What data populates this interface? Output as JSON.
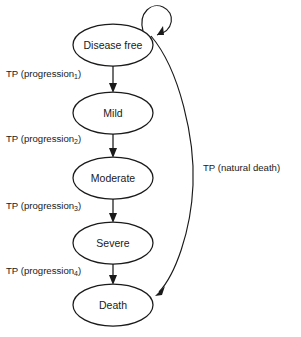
{
  "diagram": {
    "type": "state-transition-diagram",
    "title": "",
    "nodes": [
      {
        "id": "disease-free",
        "label": "Disease free",
        "cx": 113,
        "cy": 45,
        "rx": 40,
        "ry": 21
      },
      {
        "id": "mild",
        "label": "Mild",
        "cx": 113,
        "cy": 113,
        "rx": 40,
        "ry": 21
      },
      {
        "id": "moderate",
        "label": "Moderate",
        "cx": 113,
        "cy": 178,
        "rx": 40,
        "ry": 21
      },
      {
        "id": "severe",
        "label": "Severe",
        "cx": 113,
        "cy": 243,
        "rx": 40,
        "ry": 21
      },
      {
        "id": "death",
        "label": "Death",
        "cx": 113,
        "cy": 305,
        "rx": 40,
        "ry": 21
      }
    ],
    "edges": [
      {
        "id": "progression-1",
        "from": "disease-free",
        "to": "mild",
        "label_prefix": "TP (progression",
        "label_sub": "1",
        "label_suffix": ")",
        "label_x": 6,
        "label_y": 74,
        "style": "straight-down"
      },
      {
        "id": "progression-2",
        "from": "mild",
        "to": "moderate",
        "label_prefix": "TP (progression",
        "label_sub": "2",
        "label_suffix": ")",
        "label_x": 6,
        "label_y": 139,
        "style": "straight-down"
      },
      {
        "id": "progression-3",
        "from": "moderate",
        "to": "severe",
        "label_prefix": "TP (progression",
        "label_sub": "3",
        "label_suffix": ")",
        "label_x": 6,
        "label_y": 206,
        "style": "straight-down"
      },
      {
        "id": "progression-4",
        "from": "severe",
        "to": "death",
        "label_prefix": "TP (progression",
        "label_sub": "4",
        "label_suffix": ")",
        "label_x": 6,
        "label_y": 271,
        "style": "straight-down"
      },
      {
        "id": "natural-death",
        "from": "disease-free",
        "to": "death",
        "label_prefix": "TP (natural death)",
        "label_sub": "",
        "label_suffix": "",
        "label_x": 203,
        "label_y": 168,
        "style": "curve-right"
      },
      {
        "id": "stay-disease-free",
        "from": "disease-free",
        "to": "disease-free",
        "label_prefix": "",
        "label_sub": "",
        "label_suffix": "",
        "label_x": 0,
        "label_y": 0,
        "style": "self-loop"
      }
    ],
    "colors": {
      "stroke": "#1a1a1a",
      "node_fill": "#ffffff",
      "background": "#ffffff",
      "text": "#1a1a1a"
    }
  }
}
